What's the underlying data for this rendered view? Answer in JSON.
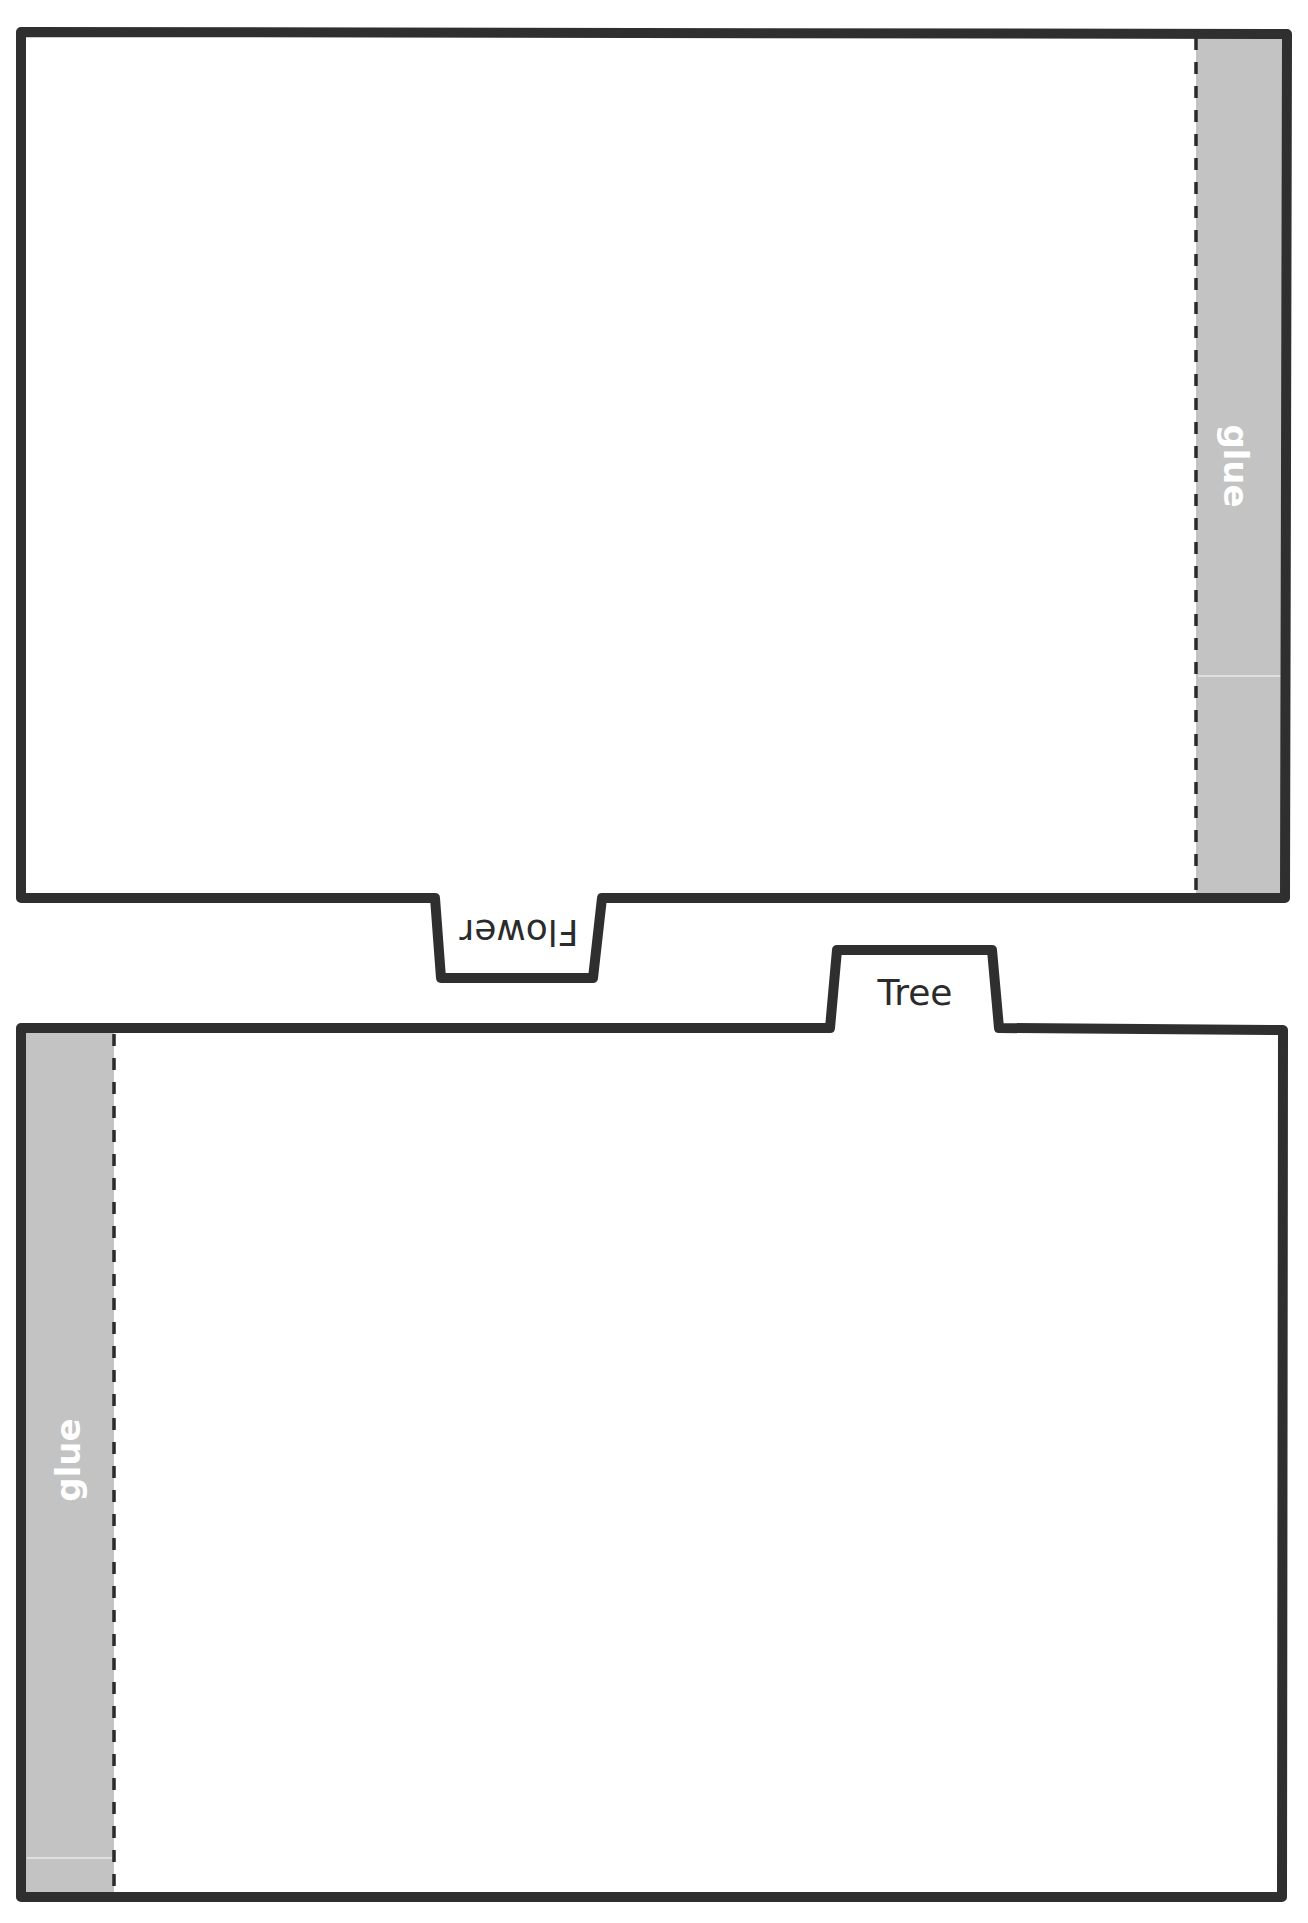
{
  "sheet": {
    "colors": {
      "outline": "#2f2f2f",
      "glue_fill": "#c3c3c3",
      "glue_text": "#ffffff",
      "tab_text": "#2b2b2b",
      "background": "#ffffff"
    },
    "top_card": {
      "tab_label": "Flower",
      "tab_orientation": "upside-down",
      "glue_label": "glue",
      "glue_side": "right"
    },
    "bottom_card": {
      "tab_label": "Tree",
      "tab_orientation": "upright",
      "glue_label": "glue",
      "glue_side": "left"
    }
  }
}
